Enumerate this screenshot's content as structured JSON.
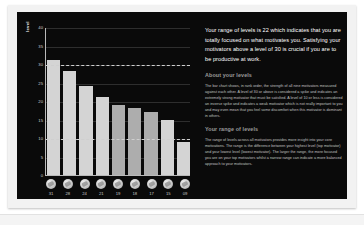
{
  "chart_data": {
    "type": "bar",
    "title": "",
    "xlabel": "",
    "ylabel": "level",
    "ylim": [
      0,
      40
    ],
    "grid": true,
    "legend": "none",
    "categories": [
      "31",
      "28",
      "24",
      "21",
      "19",
      "18",
      "17",
      "15",
      "09"
    ],
    "values": [
      31,
      28,
      24,
      21,
      19,
      18,
      17,
      15,
      9
    ],
    "ytick_labels": [
      "0",
      "5",
      "10",
      "15",
      "20",
      "25",
      "30",
      "35",
      "40"
    ],
    "ytick_values": [
      0,
      5,
      10,
      15,
      20,
      25,
      30,
      35,
      40
    ],
    "reference_lines": [
      30,
      10
    ],
    "bar_icons": [
      "motivator-icon-1",
      "motivator-icon-2",
      "motivator-icon-3",
      "motivator-icon-4",
      "motivator-icon-5",
      "motivator-icon-6",
      "motivator-icon-7",
      "motivator-icon-8",
      "motivator-icon-9"
    ]
  },
  "panel": {
    "intro": "Your range of levels is 22 which indicates that you are totally focused on what motivates you. Satisfying your motivators above a level of 30 is crucial if you are to be productive at work.",
    "sections": [
      {
        "heading": "About your levels",
        "body": "The bar chart shows, in rank order, the strength of all nine motivators measured against each other. A level of 30 or above is considered a spike and indicates an extremely strong motivator that must be satisfied. A level of 10 or less is considered an inverse spike and indicates a weak motivator which is not really important to you and may even mean that you feel some discomfort when this motivator is dominant in others."
      },
      {
        "heading": "Your range of levels",
        "body": "The range of levels across all motivators provides more insight into your core motivations. The range is the difference between your highest level (top motivator) and your lowest level (lowest motivator). The larger the range, the more focused you are on your top motivators whilst a narrow range can indicate a more balanced approach to your motivators."
      }
    ]
  },
  "colors": {
    "card_background": "#0a0a0a",
    "sheet_background": "#f2f2f2",
    "bar_light": "#d4d4d4",
    "bar_mid": "#adadad",
    "axis": "#b9b9b9",
    "reference_line": "#cfcfcf",
    "heading": "#9a9a9a",
    "body_text": "#c2c2c2",
    "intro_text": "#ffffff"
  }
}
